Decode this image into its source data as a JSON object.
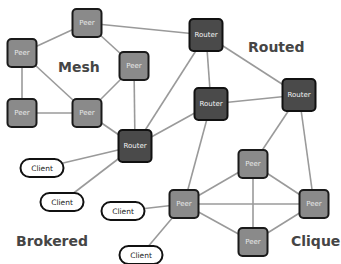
{
  "diagram": {
    "title": "",
    "colors": {
      "peer_fill": "#8a8a8a",
      "router_fill": "#4a4a4a",
      "client_fill": "#ffffff",
      "edge": "#9a9a9a",
      "group_label": "#454545"
    },
    "groups": [
      {
        "id": "mesh",
        "label": "Mesh",
        "x": 58,
        "y": 72
      },
      {
        "id": "routed",
        "label": "Routed",
        "x": 248,
        "y": 52
      },
      {
        "id": "brokered",
        "label": "Brokered",
        "x": 16,
        "y": 246
      },
      {
        "id": "clique",
        "label": "Clique",
        "x": 291,
        "y": 246
      }
    ],
    "nodes": [
      {
        "id": "p1",
        "type": "peer",
        "label": "Peer",
        "cx": 87,
        "cy": 23
      },
      {
        "id": "p2",
        "type": "peer",
        "label": "Peer",
        "cx": 22,
        "cy": 53
      },
      {
        "id": "p3",
        "type": "peer",
        "label": "Peer",
        "cx": 134,
        "cy": 66
      },
      {
        "id": "p4",
        "type": "peer",
        "label": "Peer",
        "cx": 22,
        "cy": 113
      },
      {
        "id": "p5",
        "type": "peer",
        "label": "Peer",
        "cx": 87,
        "cy": 113
      },
      {
        "id": "r1",
        "type": "router",
        "label": "Router",
        "cx": 206,
        "cy": 35
      },
      {
        "id": "r2",
        "type": "router",
        "label": "Router",
        "cx": 211,
        "cy": 104
      },
      {
        "id": "r3",
        "type": "router",
        "label": "Router",
        "cx": 299,
        "cy": 95
      },
      {
        "id": "r4",
        "type": "router",
        "label": "Router",
        "cx": 135,
        "cy": 146
      },
      {
        "id": "c1",
        "type": "client",
        "label": "Client",
        "cx": 42,
        "cy": 168
      },
      {
        "id": "c2",
        "type": "client",
        "label": "Client",
        "cx": 62,
        "cy": 202
      },
      {
        "id": "c3",
        "type": "client",
        "label": "Client",
        "cx": 123,
        "cy": 211
      },
      {
        "id": "c4",
        "type": "client",
        "label": "Client",
        "cx": 141,
        "cy": 255
      },
      {
        "id": "q1",
        "type": "peer",
        "label": "Peer",
        "cx": 253,
        "cy": 164
      },
      {
        "id": "q2",
        "type": "peer",
        "label": "Peer",
        "cx": 184,
        "cy": 204
      },
      {
        "id": "q3",
        "type": "peer",
        "label": "Peer",
        "cx": 314,
        "cy": 204
      },
      {
        "id": "q4",
        "type": "peer",
        "label": "Peer",
        "cx": 253,
        "cy": 242
      }
    ],
    "edges": [
      [
        "p1",
        "p2"
      ],
      [
        "p1",
        "p3"
      ],
      [
        "p1",
        "r1"
      ],
      [
        "p2",
        "p4"
      ],
      [
        "p2",
        "p5"
      ],
      [
        "p4",
        "p5"
      ],
      [
        "p5",
        "p3"
      ],
      [
        "p5",
        "r4"
      ],
      [
        "p3",
        "r4"
      ],
      [
        "r1",
        "r2"
      ],
      [
        "r1",
        "r3"
      ],
      [
        "r1",
        "r4"
      ],
      [
        "r2",
        "r3"
      ],
      [
        "r2",
        "r4"
      ],
      [
        "r2",
        "q2"
      ],
      [
        "r3",
        "q1"
      ],
      [
        "r3",
        "q3"
      ],
      [
        "r4",
        "c1"
      ],
      [
        "r4",
        "c2"
      ],
      [
        "q2",
        "c3"
      ],
      [
        "q2",
        "c4"
      ],
      [
        "q1",
        "q2"
      ],
      [
        "q1",
        "q3"
      ],
      [
        "q1",
        "q4"
      ],
      [
        "q2",
        "q3"
      ],
      [
        "q2",
        "q4"
      ],
      [
        "q3",
        "q4"
      ]
    ]
  }
}
